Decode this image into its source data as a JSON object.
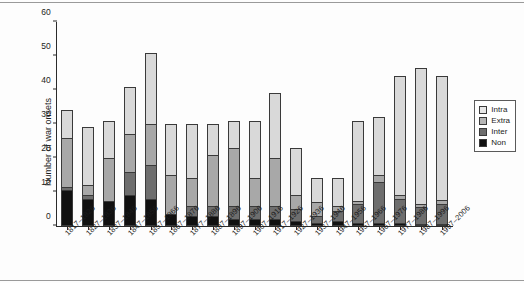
{
  "chart_data": {
    "type": "bar",
    "title": "",
    "xlabel": "",
    "ylabel": "Number of war onsets",
    "ylim": [
      0,
      60
    ],
    "yticks": [
      0,
      10,
      20,
      30,
      40,
      50,
      60
    ],
    "stacked": true,
    "grid": false,
    "legend_position": "right",
    "categories": [
      "1817–1826",
      "1827–1836",
      "1837–1846",
      "1847–1856",
      "1857–1866",
      "1867–1876",
      "1877–1886",
      "1887–1896",
      "1897–1906",
      "1907–1916",
      "1917–1926",
      "1927–1936",
      "1937–1946",
      "1947–1956",
      "1957–1966",
      "1967–1976",
      "1977–1986",
      "1987–1996",
      "1997–2006"
    ],
    "series": [
      {
        "name": "Non",
        "color": "#111111",
        "values": [
          10.5,
          8,
          7.5,
          9,
          8,
          3.5,
          3,
          3,
          2,
          2,
          2,
          1.5,
          1,
          1.5,
          1,
          1,
          1,
          0.5,
          0.5
        ]
      },
      {
        "name": "Inter",
        "color": "#6e6e6e",
        "values": [
          1,
          1,
          0,
          7,
          10,
          0,
          3,
          3,
          4,
          4,
          4,
          3.5,
          2,
          3,
          5.5,
          12,
          7,
          5,
          6
        ]
      },
      {
        "name": "Extra",
        "color": "#a8a8a8",
        "values": [
          14.5,
          3,
          12.5,
          11,
          12,
          11.5,
          8,
          15,
          17,
          8,
          14,
          4,
          4,
          1.5,
          1,
          2,
          1,
          1,
          1
        ]
      },
      {
        "name": "Intra",
        "color": "#d9d9d9",
        "values": [
          8,
          17,
          11,
          14,
          21,
          15,
          16,
          9,
          8,
          17,
          19,
          14,
          7,
          8,
          23.5,
          17,
          35,
          40,
          36.5
        ]
      }
    ],
    "totals": [
      34,
      29,
      31,
      41,
      51,
      30,
      30,
      30,
      31,
      31,
      39,
      23,
      14,
      14,
      31,
      32,
      44,
      46.5,
      44
    ],
    "legend": [
      {
        "label": "Intra",
        "color": "#e8e8e8"
      },
      {
        "label": "Extra",
        "color": "#b6b6b6"
      },
      {
        "label": "Inter",
        "color": "#6e6e6e"
      },
      {
        "label": "Non",
        "color": "#111111"
      }
    ]
  },
  "axis": {
    "y_label": "Number of war onsets",
    "y_ticks": [
      "0",
      "10",
      "20",
      "30",
      "40",
      "50",
      "60"
    ]
  }
}
